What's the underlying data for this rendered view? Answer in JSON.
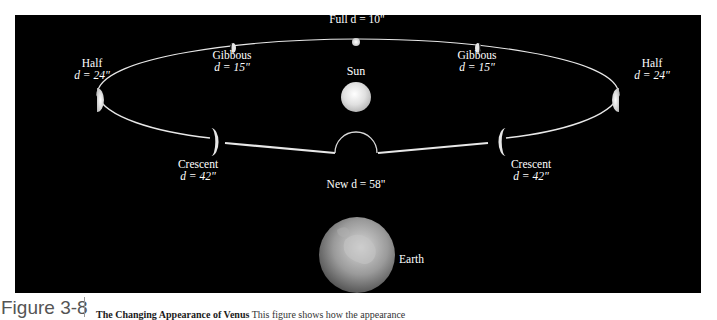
{
  "figure": {
    "number": "Figure 3-8",
    "caption_title": "The Changing Appearance of Venus",
    "caption_text": "This figure shows how the appearance"
  },
  "diagram": {
    "background": "#000000",
    "orbit_color": "#e8e8e8",
    "center": {
      "label": "Sun"
    },
    "observer": {
      "label": "Earth"
    },
    "phases": [
      {
        "id": "full",
        "name": "Full",
        "d_label": "d = 10\"",
        "label": "Full d = 10\""
      },
      {
        "id": "gibbous-left",
        "name": "Gibbous",
        "d_label": "d = 15\""
      },
      {
        "id": "gibbous-right",
        "name": "Gibbous",
        "d_label": "d = 15\""
      },
      {
        "id": "half-left",
        "name": "Half",
        "d_label": "d = 24\""
      },
      {
        "id": "half-right",
        "name": "Half",
        "d_label": "d = 24\""
      },
      {
        "id": "crescent-left",
        "name": "Crescent",
        "d_label": "d = 42\""
      },
      {
        "id": "crescent-right",
        "name": "Crescent",
        "d_label": "d = 42\""
      },
      {
        "id": "new",
        "name": "New",
        "d_label": "d = 58\"",
        "label": "New d = 58\""
      }
    ]
  }
}
